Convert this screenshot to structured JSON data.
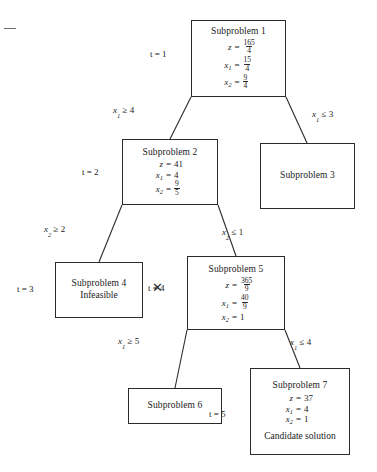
{
  "figure": {
    "type": "branch-and-bound-tree",
    "page_mark": "—"
  },
  "nodes": {
    "sp1": {
      "title": "Subproblem 1",
      "t_label": "t = 1",
      "equations": [
        {
          "lhs": "z",
          "sub": "",
          "op": "=",
          "num": "165",
          "den": "4"
        },
        {
          "lhs": "x",
          "sub": "1",
          "op": "=",
          "num": "15",
          "den": "4"
        },
        {
          "lhs": "x",
          "sub": "2",
          "op": "=",
          "num": "9",
          "den": "4"
        }
      ]
    },
    "sp2": {
      "title": "Subproblem 2",
      "t_label": "t = 2",
      "equations": [
        {
          "lhs": "z",
          "sub": "",
          "op": "=",
          "value": "41"
        },
        {
          "lhs": "x",
          "sub": "1",
          "op": "=",
          "value": "4"
        },
        {
          "lhs": "x",
          "sub": "2",
          "op": "=",
          "num": "9",
          "den": "5"
        }
      ]
    },
    "sp3": {
      "title": "Subproblem 3"
    },
    "sp4": {
      "title": "Subproblem 4",
      "note": "Infeasible",
      "t_label": "t = 3",
      "prune_mark": "✕"
    },
    "sp5": {
      "title": "Subproblem 5",
      "t_label": "t = 4",
      "equations": [
        {
          "lhs": "z",
          "sub": "",
          "op": "=",
          "num": "365",
          "den": "9"
        },
        {
          "lhs": "x",
          "sub": "1",
          "op": "=",
          "num": "40",
          "den": "9"
        },
        {
          "lhs": "x",
          "sub": "2",
          "op": "=",
          "value": "1"
        }
      ]
    },
    "sp6": {
      "title": "Subproblem 6"
    },
    "sp7": {
      "title": "Subproblem 7",
      "t_label": "t = 5",
      "note": "Candidate solution",
      "equations": [
        {
          "lhs": "z",
          "sub": "",
          "op": "=",
          "value": "37"
        },
        {
          "lhs": "x",
          "sub": "1",
          "op": "=",
          "value": "4"
        },
        {
          "lhs": "x",
          "sub": "2",
          "op": "=",
          "value": "1"
        }
      ]
    }
  },
  "branches": {
    "b1_left": {
      "var": "x",
      "sub": "1",
      "rel": "≥",
      "bound": "4"
    },
    "b1_right": {
      "var": "x",
      "sub": "1",
      "rel": "≤",
      "bound": "3"
    },
    "b2_left": {
      "var": "x",
      "sub": "2",
      "rel": "≥",
      "bound": "2"
    },
    "b2_right": {
      "var": "x",
      "sub": "2",
      "rel": "≤",
      "bound": "1"
    },
    "b5_left": {
      "var": "x",
      "sub": "1",
      "rel": "≥",
      "bound": "5"
    },
    "b5_right": {
      "var": "x",
      "sub": "1",
      "rel": "≤",
      "bound": "4"
    }
  },
  "colors": {
    "ink": "#2b2b2b",
    "line": "#2b2b2b",
    "background": "#ffffff"
  }
}
